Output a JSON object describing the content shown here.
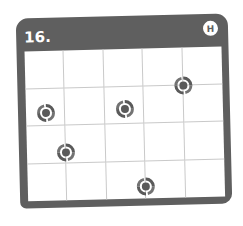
{
  "puzzle": {
    "number_label": "16.",
    "difficulty_badge": "H",
    "grid": {
      "columns": 5,
      "rows": 4
    },
    "frame_color": "#5f5f5f",
    "gridline_color": "#c9c9c9",
    "spiral_color": "#5a5a5a",
    "spirals": [
      {
        "icon": "spiral-icon",
        "x_pct": 80,
        "y_pct": 25
      },
      {
        "icon": "spiral-icon",
        "x_pct": 10,
        "y_pct": 41
      },
      {
        "icon": "spiral-icon",
        "x_pct": 50,
        "y_pct": 40
      },
      {
        "icon": "spiral-icon",
        "x_pct": 20,
        "y_pct": 68
      },
      {
        "icon": "spiral-icon",
        "x_pct": 60,
        "y_pct": 92
      }
    ]
  }
}
